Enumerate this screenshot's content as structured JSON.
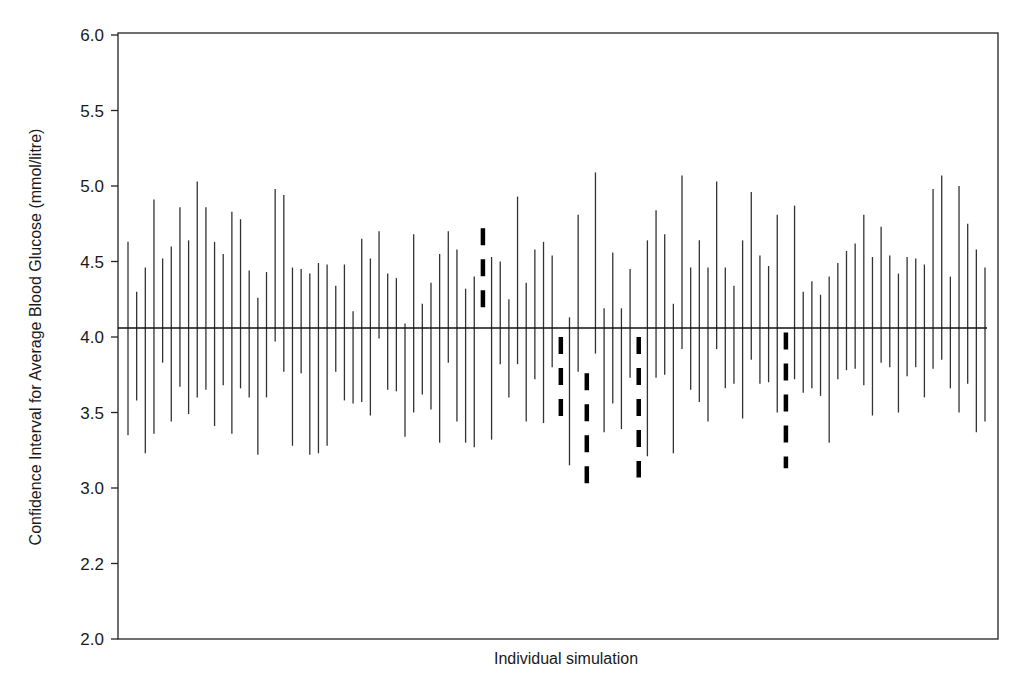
{
  "chart_data": {
    "type": "errorbar",
    "title": "",
    "xlabel": "Individual simulation",
    "ylabel": "Confidence Interval for Average Blood Glucose (mmol/litre)",
    "ylim": [
      2.0,
      6.0
    ],
    "y_ticks": [
      {
        "label": "6.0",
        "value": 6.0
      },
      {
        "label": "5.5",
        "value": 5.5
      },
      {
        "label": "5.0",
        "value": 5.0
      },
      {
        "label": "4.5",
        "value": 4.5
      },
      {
        "label": "4.0",
        "value": 4.0
      },
      {
        "label": "3.5",
        "value": 3.5
      },
      {
        "label": "3.0",
        "value": 3.0
      },
      {
        "label": "2.2",
        "value": 2.5
      },
      {
        "label": "2.0",
        "value": 2.0
      }
    ],
    "grid": false,
    "legend": null,
    "reference_line": {
      "label": "true mean",
      "value": 4.06
    },
    "n_simulations": 100,
    "note": "Dashed intervals are those that do not contain the reference mean",
    "intervals": [
      {
        "sim": 1,
        "lower": 3.35,
        "upper": 4.63,
        "dashed": false
      },
      {
        "sim": 2,
        "lower": 3.58,
        "upper": 4.3,
        "dashed": false
      },
      {
        "sim": 3,
        "lower": 3.23,
        "upper": 4.46,
        "dashed": false
      },
      {
        "sim": 4,
        "lower": 3.36,
        "upper": 4.91,
        "dashed": false
      },
      {
        "sim": 5,
        "lower": 3.83,
        "upper": 4.52,
        "dashed": false
      },
      {
        "sim": 6,
        "lower": 3.44,
        "upper": 4.6,
        "dashed": false
      },
      {
        "sim": 7,
        "lower": 3.67,
        "upper": 4.86,
        "dashed": false
      },
      {
        "sim": 8,
        "lower": 3.49,
        "upper": 4.64,
        "dashed": false
      },
      {
        "sim": 9,
        "lower": 3.6,
        "upper": 5.03,
        "dashed": false
      },
      {
        "sim": 10,
        "lower": 3.65,
        "upper": 4.86,
        "dashed": false
      },
      {
        "sim": 11,
        "lower": 3.41,
        "upper": 4.63,
        "dashed": false
      },
      {
        "sim": 12,
        "lower": 3.68,
        "upper": 4.55,
        "dashed": false
      },
      {
        "sim": 13,
        "lower": 3.36,
        "upper": 4.83,
        "dashed": false
      },
      {
        "sim": 14,
        "lower": 3.66,
        "upper": 4.78,
        "dashed": false
      },
      {
        "sim": 15,
        "lower": 3.6,
        "upper": 4.44,
        "dashed": false
      },
      {
        "sim": 16,
        "lower": 3.22,
        "upper": 4.26,
        "dashed": false
      },
      {
        "sim": 17,
        "lower": 3.6,
        "upper": 4.43,
        "dashed": false
      },
      {
        "sim": 18,
        "lower": 3.97,
        "upper": 4.98,
        "dashed": false
      },
      {
        "sim": 19,
        "lower": 3.77,
        "upper": 4.94,
        "dashed": false
      },
      {
        "sim": 20,
        "lower": 3.28,
        "upper": 4.46,
        "dashed": false
      },
      {
        "sim": 21,
        "lower": 3.76,
        "upper": 4.45,
        "dashed": false
      },
      {
        "sim": 22,
        "lower": 3.22,
        "upper": 4.42,
        "dashed": false
      },
      {
        "sim": 23,
        "lower": 3.23,
        "upper": 4.49,
        "dashed": false
      },
      {
        "sim": 24,
        "lower": 3.28,
        "upper": 4.48,
        "dashed": false
      },
      {
        "sim": 25,
        "lower": 3.77,
        "upper": 4.34,
        "dashed": false
      },
      {
        "sim": 26,
        "lower": 3.58,
        "upper": 4.48,
        "dashed": false
      },
      {
        "sim": 27,
        "lower": 3.56,
        "upper": 4.17,
        "dashed": false
      },
      {
        "sim": 28,
        "lower": 3.57,
        "upper": 4.65,
        "dashed": false
      },
      {
        "sim": 29,
        "lower": 3.48,
        "upper": 4.52,
        "dashed": false
      },
      {
        "sim": 30,
        "lower": 3.99,
        "upper": 4.7,
        "dashed": false
      },
      {
        "sim": 31,
        "lower": 3.65,
        "upper": 4.42,
        "dashed": false
      },
      {
        "sim": 32,
        "lower": 3.64,
        "upper": 4.39,
        "dashed": false
      },
      {
        "sim": 33,
        "lower": 3.34,
        "upper": 4.09,
        "dashed": false
      },
      {
        "sim": 34,
        "lower": 3.5,
        "upper": 4.68,
        "dashed": false
      },
      {
        "sim": 35,
        "lower": 3.62,
        "upper": 4.22,
        "dashed": false
      },
      {
        "sim": 36,
        "lower": 3.52,
        "upper": 4.36,
        "dashed": false
      },
      {
        "sim": 37,
        "lower": 3.3,
        "upper": 4.55,
        "dashed": false
      },
      {
        "sim": 38,
        "lower": 3.83,
        "upper": 4.7,
        "dashed": false
      },
      {
        "sim": 39,
        "lower": 3.44,
        "upper": 4.58,
        "dashed": false
      },
      {
        "sim": 40,
        "lower": 3.3,
        "upper": 4.32,
        "dashed": false
      },
      {
        "sim": 41,
        "lower": 3.27,
        "upper": 4.4,
        "dashed": false
      },
      {
        "sim": 42,
        "lower": 4.19,
        "upper": 4.72,
        "dashed": true
      },
      {
        "sim": 43,
        "lower": 3.32,
        "upper": 4.53,
        "dashed": false
      },
      {
        "sim": 44,
        "lower": 3.82,
        "upper": 4.5,
        "dashed": false
      },
      {
        "sim": 45,
        "lower": 3.6,
        "upper": 4.25,
        "dashed": false
      },
      {
        "sim": 46,
        "lower": 3.82,
        "upper": 4.93,
        "dashed": false
      },
      {
        "sim": 47,
        "lower": 3.44,
        "upper": 4.36,
        "dashed": false
      },
      {
        "sim": 48,
        "lower": 3.72,
        "upper": 4.58,
        "dashed": false
      },
      {
        "sim": 49,
        "lower": 3.43,
        "upper": 4.63,
        "dashed": false
      },
      {
        "sim": 50,
        "lower": 3.8,
        "upper": 4.54,
        "dashed": false
      },
      {
        "sim": 51,
        "lower": 3.46,
        "upper": 4.0,
        "dashed": true
      },
      {
        "sim": 52,
        "lower": 3.15,
        "upper": 4.13,
        "dashed": false
      },
      {
        "sim": 53,
        "lower": 3.77,
        "upper": 4.81,
        "dashed": false
      },
      {
        "sim": 54,
        "lower": 3.02,
        "upper": 3.76,
        "dashed": true
      },
      {
        "sim": 55,
        "lower": 3.89,
        "upper": 5.09,
        "dashed": false
      },
      {
        "sim": 56,
        "lower": 3.37,
        "upper": 4.19,
        "dashed": false
      },
      {
        "sim": 57,
        "lower": 3.56,
        "upper": 4.56,
        "dashed": false
      },
      {
        "sim": 58,
        "lower": 3.39,
        "upper": 4.19,
        "dashed": false
      },
      {
        "sim": 59,
        "lower": 3.73,
        "upper": 4.45,
        "dashed": false
      },
      {
        "sim": 60,
        "lower": 3.07,
        "upper": 4.0,
        "dashed": true
      },
      {
        "sim": 61,
        "lower": 3.21,
        "upper": 4.64,
        "dashed": false
      },
      {
        "sim": 62,
        "lower": 3.73,
        "upper": 4.84,
        "dashed": false
      },
      {
        "sim": 63,
        "lower": 3.75,
        "upper": 4.68,
        "dashed": false
      },
      {
        "sim": 64,
        "lower": 3.23,
        "upper": 4.22,
        "dashed": false
      },
      {
        "sim": 65,
        "lower": 3.92,
        "upper": 5.07,
        "dashed": false
      },
      {
        "sim": 66,
        "lower": 3.65,
        "upper": 4.46,
        "dashed": false
      },
      {
        "sim": 67,
        "lower": 3.57,
        "upper": 4.64,
        "dashed": false
      },
      {
        "sim": 68,
        "lower": 3.44,
        "upper": 4.46,
        "dashed": false
      },
      {
        "sim": 69,
        "lower": 3.92,
        "upper": 5.03,
        "dashed": false
      },
      {
        "sim": 70,
        "lower": 3.66,
        "upper": 4.46,
        "dashed": false
      },
      {
        "sim": 71,
        "lower": 3.69,
        "upper": 4.34,
        "dashed": false
      },
      {
        "sim": 72,
        "lower": 3.46,
        "upper": 4.64,
        "dashed": false
      },
      {
        "sim": 73,
        "lower": 3.85,
        "upper": 4.96,
        "dashed": false
      },
      {
        "sim": 74,
        "lower": 3.69,
        "upper": 4.54,
        "dashed": false
      },
      {
        "sim": 75,
        "lower": 3.7,
        "upper": 4.47,
        "dashed": false
      },
      {
        "sim": 76,
        "lower": 3.5,
        "upper": 4.81,
        "dashed": false
      },
      {
        "sim": 77,
        "lower": 3.13,
        "upper": 4.03,
        "dashed": true
      },
      {
        "sim": 78,
        "lower": 3.72,
        "upper": 4.87,
        "dashed": false
      },
      {
        "sim": 79,
        "lower": 3.63,
        "upper": 4.3,
        "dashed": false
      },
      {
        "sim": 80,
        "lower": 3.66,
        "upper": 4.37,
        "dashed": false
      },
      {
        "sim": 81,
        "lower": 3.61,
        "upper": 4.28,
        "dashed": false
      },
      {
        "sim": 82,
        "lower": 3.3,
        "upper": 4.4,
        "dashed": false
      },
      {
        "sim": 83,
        "lower": 3.72,
        "upper": 4.49,
        "dashed": false
      },
      {
        "sim": 84,
        "lower": 3.78,
        "upper": 4.57,
        "dashed": false
      },
      {
        "sim": 85,
        "lower": 3.79,
        "upper": 4.62,
        "dashed": false
      },
      {
        "sim": 86,
        "lower": 3.68,
        "upper": 4.81,
        "dashed": false
      },
      {
        "sim": 87,
        "lower": 3.48,
        "upper": 4.53,
        "dashed": false
      },
      {
        "sim": 88,
        "lower": 3.83,
        "upper": 4.73,
        "dashed": false
      },
      {
        "sim": 89,
        "lower": 3.8,
        "upper": 4.54,
        "dashed": false
      },
      {
        "sim": 90,
        "lower": 3.5,
        "upper": 4.42,
        "dashed": false
      },
      {
        "sim": 91,
        "lower": 3.74,
        "upper": 4.53,
        "dashed": false
      },
      {
        "sim": 92,
        "lower": 3.8,
        "upper": 4.52,
        "dashed": false
      },
      {
        "sim": 93,
        "lower": 3.6,
        "upper": 4.48,
        "dashed": false
      },
      {
        "sim": 94,
        "lower": 3.79,
        "upper": 4.98,
        "dashed": false
      },
      {
        "sim": 95,
        "lower": 3.85,
        "upper": 5.07,
        "dashed": false
      },
      {
        "sim": 96,
        "lower": 3.66,
        "upper": 4.4,
        "dashed": false
      },
      {
        "sim": 97,
        "lower": 3.5,
        "upper": 5.0,
        "dashed": false
      },
      {
        "sim": 98,
        "lower": 3.69,
        "upper": 4.75,
        "dashed": false
      },
      {
        "sim": 99,
        "lower": 3.37,
        "upper": 4.58,
        "dashed": false
      },
      {
        "sim": 100,
        "lower": 3.44,
        "upper": 4.46,
        "dashed": false
      }
    ]
  },
  "style": {
    "bar_color": "#333333",
    "dashed_color": "#000000",
    "axis_color": "#222222",
    "background": "#ffffff"
  }
}
